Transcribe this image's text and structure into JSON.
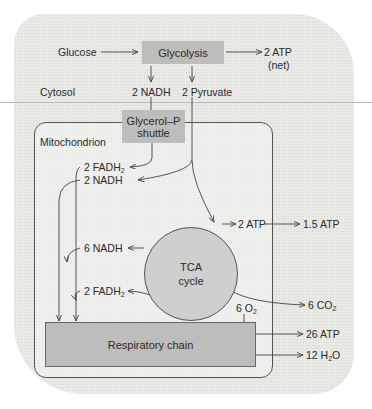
{
  "diagram": {
    "regions": {
      "cytosol": "Cytosol",
      "mitochondrion": "Mitochondrion"
    },
    "nodes": {
      "glucose": "Glucose",
      "glycolysis": "Glycolysis",
      "atp_glycolysis": "2 ATP",
      "atp_glycolysis_note": "(net)",
      "nadh_cytosol": "2 NADH",
      "pyruvate": "2 Pyruvate",
      "shuttle_line1": "Glycerol–P",
      "shuttle_line2": "shuttle",
      "fadh2_shuttle": "2 FADH",
      "fadh2_shuttle_sub": "2",
      "nadh_pdh": "2 NADH",
      "atp_tca": "2 ATP",
      "atp_tca_converted": "1.5 ATP",
      "tca_line1": "TCA",
      "tca_line2": "cycle",
      "nadh_tca": "6 NADH",
      "co2": "6 CO",
      "co2_sub": "2",
      "fadh2_tca": "2 FADH",
      "fadh2_tca_sub": "2",
      "o2": "6 O",
      "o2_sub": "2",
      "respiratory_chain": "Respiratory chain",
      "atp_resp": "26 ATP",
      "h2o_pre": "12 H",
      "h2o_sub": "2",
      "h2o_post": "O"
    },
    "colors": {
      "box_fill": "#bdbdbb",
      "circle_fill": "#cfcfcd",
      "background": "#e9e9e6",
      "stroke": "#555555"
    }
  }
}
